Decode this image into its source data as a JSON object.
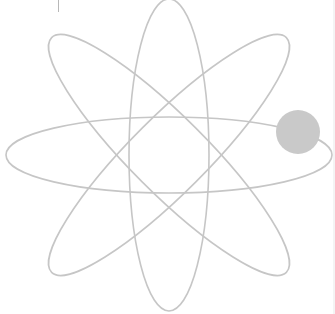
{
  "figure": {
    "label": "atom symbol",
    "stroke_color": "#c6c6c6",
    "stroke_width": 1.6,
    "nucleus_center": [
      169,
      155
    ],
    "orbits": [
      {
        "name": "horizontal-orbit",
        "rx": 163,
        "ry": 38,
        "rotation": 0
      },
      {
        "name": "vertical-orbit",
        "rx": 40,
        "ry": 156,
        "rotation": 0
      },
      {
        "name": "diagonal-orbit-1",
        "rx": 166,
        "ry": 38,
        "rotation": 45
      },
      {
        "name": "diagonal-orbit-2",
        "rx": 166,
        "ry": 38,
        "rotation": -45
      }
    ],
    "electron": {
      "cx": 298,
      "cy": 132,
      "r": 22,
      "color": "#c9c9c9"
    }
  }
}
